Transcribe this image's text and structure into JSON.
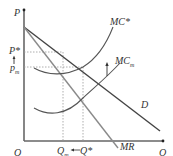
{
  "diagram": {
    "type": "economics-supply-demand",
    "axes": {
      "y_label": "P",
      "x_label": "Q",
      "origin_label": "O"
    },
    "curves": [
      {
        "id": "D",
        "label": "D",
        "kind": "demand",
        "color": "#444444"
      },
      {
        "id": "MR",
        "label": "MR",
        "kind": "marginal-revenue",
        "color": "#8a8a8a"
      },
      {
        "id": "MC_star",
        "label": "MC*",
        "kind": "marginal-cost",
        "color": "#555555"
      },
      {
        "id": "MC_m",
        "label": "MC",
        "label_sub": "m",
        "kind": "marginal-cost",
        "color": "#555555"
      }
    ],
    "price_labels": {
      "p_star": "P*",
      "p_m": "p",
      "p_m_sub": "m"
    },
    "quantity_labels": {
      "q_m": "Q",
      "q_m_sub": "m",
      "q_star": "Q*",
      "shift_arrow": "←"
    },
    "arrows": {
      "mc_shift": "↑",
      "price_shift": "↑"
    }
  }
}
